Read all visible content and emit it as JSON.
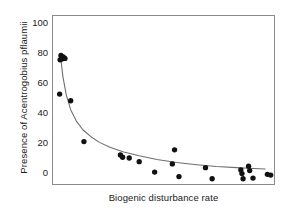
{
  "chart_data": {
    "type": "scatter",
    "title": "",
    "xlabel": "Biogenic disturbance rate",
    "ylabel": "Presence of Acentrogobius pflaumii",
    "xlim": [
      0,
      100
    ],
    "ylim": [
      -8,
      105
    ],
    "grid": false,
    "legend": null,
    "xticks": [],
    "xticklabels": [],
    "yticks": [
      0,
      20,
      40,
      60,
      80,
      100
    ],
    "yticklabels": [
      "0",
      "20",
      "40",
      "60",
      "80",
      "100"
    ],
    "marker": "filled-circle",
    "marker_color": "#111111",
    "curve_color": "#6e6e6e",
    "frame_color": "#8a8a8a",
    "points": [
      {
        "x": 3.2,
        "y": 75.5
      },
      {
        "x": 3.6,
        "y": 78.5
      },
      {
        "x": 4.0,
        "y": 76.0
      },
      {
        "x": 4.6,
        "y": 77.5
      },
      {
        "x": 5.4,
        "y": 76.5
      },
      {
        "x": 3.0,
        "y": 52.5
      },
      {
        "x": 8.0,
        "y": 48.0
      },
      {
        "x": 14.0,
        "y": 20.5
      },
      {
        "x": 30.5,
        "y": 11.5
      },
      {
        "x": 31.5,
        "y": 10.0
      },
      {
        "x": 34.5,
        "y": 9.5
      },
      {
        "x": 39.0,
        "y": 7.0
      },
      {
        "x": 46.0,
        "y": 0.0
      },
      {
        "x": 54.0,
        "y": 5.5
      },
      {
        "x": 55.0,
        "y": 15.0
      },
      {
        "x": 57.0,
        "y": -3.0
      },
      {
        "x": 69.0,
        "y": 3.0
      },
      {
        "x": 72.0,
        "y": -4.5
      },
      {
        "x": 85.0,
        "y": 1.5
      },
      {
        "x": 85.5,
        "y": -1.0
      },
      {
        "x": 86.0,
        "y": -4.5
      },
      {
        "x": 88.5,
        "y": 4.0
      },
      {
        "x": 89.0,
        "y": 1.0
      },
      {
        "x": 90.5,
        "y": -4.0
      },
      {
        "x": 97.0,
        "y": -1.5
      },
      {
        "x": 98.5,
        "y": -2.0
      }
    ],
    "fit_curve": {
      "kind": "power-decay",
      "points": [
        {
          "x": 3.4,
          "y": 78.0
        },
        {
          "x": 4.5,
          "y": 64.0
        },
        {
          "x": 6.0,
          "y": 52.0
        },
        {
          "x": 8.0,
          "y": 42.0
        },
        {
          "x": 10.5,
          "y": 34.5
        },
        {
          "x": 13.5,
          "y": 28.5
        },
        {
          "x": 17.0,
          "y": 24.0
        },
        {
          "x": 21.0,
          "y": 20.0
        },
        {
          "x": 26.0,
          "y": 16.5
        },
        {
          "x": 32.0,
          "y": 13.5
        },
        {
          "x": 39.0,
          "y": 11.0
        },
        {
          "x": 47.0,
          "y": 8.5
        },
        {
          "x": 56.0,
          "y": 6.5
        },
        {
          "x": 65.0,
          "y": 5.0
        },
        {
          "x": 74.0,
          "y": 3.8
        },
        {
          "x": 83.0,
          "y": 3.0
        },
        {
          "x": 91.0,
          "y": 2.4
        },
        {
          "x": 96.0,
          "y": 2.1
        }
      ]
    }
  }
}
